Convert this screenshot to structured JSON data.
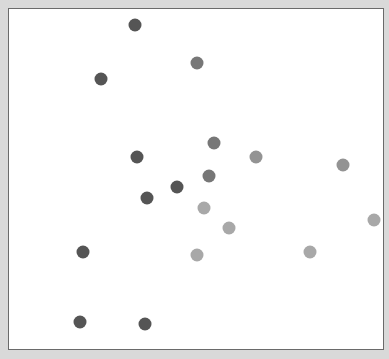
{
  "chart_data": {
    "type": "scatter",
    "title": "",
    "xlabel": "",
    "ylabel": "",
    "grid": false,
    "legend": null,
    "plot_box": {
      "left": 8,
      "top": 8,
      "right": 384,
      "bottom": 350
    },
    "series": [
      {
        "name": "dark",
        "color": "#555555",
        "points": [
          [
            134,
            24
          ],
          [
            100,
            78
          ],
          [
            136,
            156
          ],
          [
            146,
            197
          ],
          [
            176,
            186
          ],
          [
            82,
            251
          ],
          [
            79,
            321
          ],
          [
            144,
            323
          ]
        ]
      },
      {
        "name": "medium",
        "color": "#777777",
        "points": [
          [
            196,
            62
          ],
          [
            213,
            142
          ],
          [
            208,
            175
          ]
        ]
      },
      {
        "name": "light-medium",
        "color": "#939393",
        "points": [
          [
            255,
            156
          ],
          [
            342,
            164
          ]
        ]
      },
      {
        "name": "light",
        "color": "#a8a8a8",
        "points": [
          [
            203,
            207
          ],
          [
            228,
            227
          ],
          [
            196,
            254
          ],
          [
            309,
            251
          ],
          [
            373,
            219
          ]
        ]
      }
    ]
  }
}
